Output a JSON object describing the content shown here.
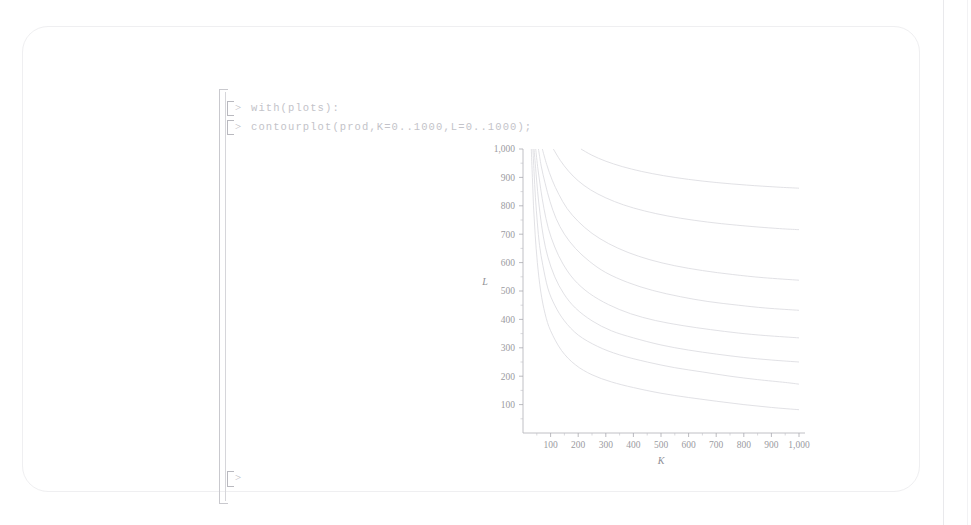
{
  "window": {
    "app": "Maple Worksheet",
    "background_color": "#ffffff",
    "card_border_color": "#efeff1"
  },
  "worksheet": {
    "prompt_symbol": ">",
    "lines": [
      {
        "prompt": ">",
        "command": "with(plots):"
      },
      {
        "prompt": ">",
        "command": "contourplot(prod,K=0..1000,L=0..1000);"
      }
    ],
    "trailing_prompt": ">"
  },
  "chart_data": {
    "type": "line",
    "title": "",
    "subtitle": "",
    "xlabel": "K",
    "ylabel": "L",
    "xlim": [
      0,
      1000
    ],
    "ylim": [
      0,
      1000
    ],
    "xticks": [
      100,
      200,
      300,
      400,
      500,
      600,
      700,
      800,
      900,
      1000
    ],
    "xticklabels": [
      "100",
      "200",
      "300",
      "400",
      "500",
      "600",
      "700",
      "800",
      "900",
      "1,000"
    ],
    "yticks": [
      100,
      200,
      300,
      400,
      500,
      600,
      700,
      800,
      900,
      1000
    ],
    "yticklabels": [
      "100",
      "200",
      "300",
      "400",
      "500",
      "600",
      "700",
      "800",
      "900",
      "1,000"
    ],
    "grid": false,
    "legend": "none",
    "minor_ticks": true,
    "curve_color": "#dcdce0",
    "axis_color": "#b0b0b6",
    "series": [
      {
        "name": "contour-1",
        "level_label": "",
        "points": [
          [
            30,
            1000
          ],
          [
            34,
            900
          ],
          [
            38,
            800
          ],
          [
            44,
            700
          ],
          [
            52,
            600
          ],
          [
            64,
            500
          ],
          [
            80,
            420
          ],
          [
            100,
            360
          ],
          [
            140,
            290
          ],
          [
            190,
            240
          ],
          [
            250,
            205
          ],
          [
            320,
            180
          ],
          [
            400,
            160
          ],
          [
            500,
            140
          ],
          [
            600,
            125
          ],
          [
            700,
            112
          ],
          [
            800,
            100
          ],
          [
            900,
            90
          ],
          [
            1000,
            82
          ]
        ]
      },
      {
        "name": "contour-2",
        "level_label": "",
        "points": [
          [
            36,
            1000
          ],
          [
            40,
            920
          ],
          [
            45,
            830
          ],
          [
            52,
            740
          ],
          [
            60,
            660
          ],
          [
            72,
            590
          ],
          [
            90,
            510
          ],
          [
            115,
            450
          ],
          [
            150,
            395
          ],
          [
            200,
            345
          ],
          [
            270,
            305
          ],
          [
            350,
            275
          ],
          [
            450,
            250
          ],
          [
            550,
            230
          ],
          [
            650,
            215
          ],
          [
            750,
            200
          ],
          [
            850,
            188
          ],
          [
            950,
            178
          ],
          [
            1000,
            172
          ]
        ]
      },
      {
        "name": "contour-3",
        "level_label": "",
        "points": [
          [
            40,
            1000
          ],
          [
            46,
            930
          ],
          [
            53,
            850
          ],
          [
            62,
            770
          ],
          [
            74,
            690
          ],
          [
            90,
            620
          ],
          [
            115,
            550
          ],
          [
            148,
            490
          ],
          [
            190,
            440
          ],
          [
            250,
            395
          ],
          [
            320,
            360
          ],
          [
            400,
            335
          ],
          [
            500,
            310
          ],
          [
            600,
            292
          ],
          [
            700,
            278
          ],
          [
            800,
            266
          ],
          [
            900,
            257
          ],
          [
            1000,
            250
          ]
        ]
      },
      {
        "name": "contour-4",
        "level_label": "",
        "points": [
          [
            46,
            1000
          ],
          [
            54,
            930
          ],
          [
            64,
            860
          ],
          [
            76,
            790
          ],
          [
            92,
            720
          ],
          [
            115,
            655
          ],
          [
            145,
            595
          ],
          [
            185,
            540
          ],
          [
            240,
            492
          ],
          [
            310,
            452
          ],
          [
            390,
            420
          ],
          [
            480,
            396
          ],
          [
            580,
            378
          ],
          [
            680,
            364
          ],
          [
            780,
            352
          ],
          [
            880,
            343
          ],
          [
            1000,
            335
          ]
        ]
      },
      {
        "name": "contour-5",
        "level_label": "",
        "points": [
          [
            56,
            1000
          ],
          [
            66,
            940
          ],
          [
            80,
            880
          ],
          [
            98,
            815
          ],
          [
            120,
            755
          ],
          [
            150,
            700
          ],
          [
            190,
            650
          ],
          [
            240,
            605
          ],
          [
            300,
            565
          ],
          [
            380,
            530
          ],
          [
            470,
            502
          ],
          [
            570,
            480
          ],
          [
            670,
            463
          ],
          [
            780,
            450
          ],
          [
            880,
            440
          ],
          [
            1000,
            432
          ]
        ]
      },
      {
        "name": "contour-6",
        "level_label": "",
        "points": [
          [
            70,
            1000
          ],
          [
            86,
            945
          ],
          [
            106,
            890
          ],
          [
            130,
            840
          ],
          [
            160,
            790
          ],
          [
            200,
            745
          ],
          [
            250,
            703
          ],
          [
            310,
            667
          ],
          [
            380,
            636
          ],
          [
            460,
            610
          ],
          [
            550,
            589
          ],
          [
            650,
            572
          ],
          [
            760,
            558
          ],
          [
            870,
            547
          ],
          [
            1000,
            538
          ]
        ]
      },
      {
        "name": "contour-7",
        "level_label": "",
        "points": [
          [
            110,
            1000
          ],
          [
            135,
            960
          ],
          [
            165,
            922
          ],
          [
            200,
            888
          ],
          [
            245,
            856
          ],
          [
            300,
            828
          ],
          [
            365,
            803
          ],
          [
            440,
            782
          ],
          [
            525,
            764
          ],
          [
            620,
            749
          ],
          [
            720,
            737
          ],
          [
            830,
            727
          ],
          [
            940,
            719
          ],
          [
            1000,
            716
          ]
        ]
      },
      {
        "name": "contour-8",
        "level_label": "",
        "points": [
          [
            210,
            1000
          ],
          [
            250,
            978
          ],
          [
            300,
            957
          ],
          [
            360,
            938
          ],
          [
            430,
            921
          ],
          [
            510,
            906
          ],
          [
            600,
            893
          ],
          [
            700,
            882
          ],
          [
            810,
            873
          ],
          [
            920,
            866
          ],
          [
            1000,
            862
          ]
        ]
      }
    ]
  }
}
